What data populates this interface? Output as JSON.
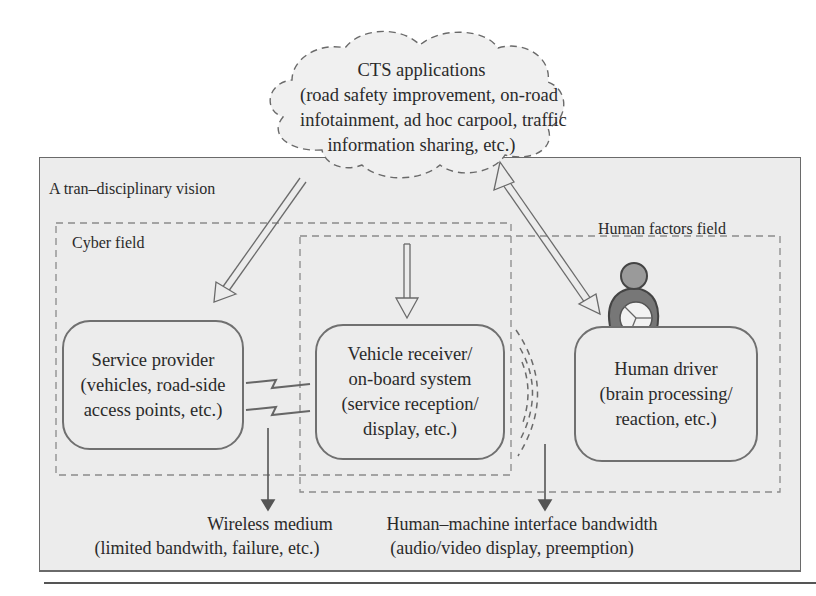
{
  "cloud": {
    "title": "CTS applications",
    "lines": [
      "(road safety improvement, on-road",
      "infotainment, ad hoc carpool, traffic",
      "information sharing, etc.)"
    ]
  },
  "outer_box": {
    "label": "A tran–disciplinary vision"
  },
  "fields": {
    "cyber": {
      "label": "Cyber field"
    },
    "human_factors": {
      "label": "Human factors field"
    }
  },
  "nodes": {
    "service_provider": {
      "lines": [
        "Service provider",
        "(vehicles, road-side",
        "access points, etc.)"
      ]
    },
    "vehicle_receiver": {
      "lines": [
        "Vehicle receiver/",
        "on-board system",
        "(service reception/",
        "display, etc.)"
      ]
    },
    "human_driver": {
      "lines": [
        "Human driver",
        "(brain processing/",
        "reaction, etc.)"
      ]
    }
  },
  "annotations": {
    "wireless": {
      "title": "Wireless medium",
      "detail": "(limited bandwith, failure, etc.)"
    },
    "hmi": {
      "title": "Human–machine interface bandwidth",
      "detail": "(audio/video display, preemption)"
    }
  },
  "icons": {
    "driver": "person-with-steering-wheel-icon"
  },
  "colors": {
    "panel_fill": "#ececec",
    "stroke": "#6a6a6a",
    "text": "#2a2a2a",
    "background": "#ffffff"
  }
}
